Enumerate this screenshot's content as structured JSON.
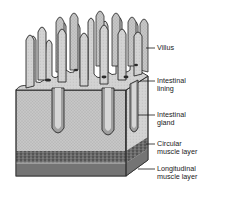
{
  "diagram": {
    "colors": {
      "tissue_fill": "#c9c9c9",
      "tissue_dark": "#8a8a8a",
      "outline": "#2a2a2a",
      "muscle_circular": "#5a5a5a",
      "muscle_longitudinal": "#7a7a7a",
      "background": "#ffffff"
    },
    "labels": [
      {
        "id": "villus",
        "line1": "Villus",
        "line2": ""
      },
      {
        "id": "intestinal-lining",
        "line1": "Intestinal",
        "line2": "lining"
      },
      {
        "id": "intestinal-gland",
        "line1": "Intestinal",
        "line2": "gland"
      },
      {
        "id": "circular-muscle-layer",
        "line1": "Circular",
        "line2": "muscle layer"
      },
      {
        "id": "longitudinal-muscle-layer",
        "line1": "Longitudinal",
        "line2": "muscle layer"
      }
    ]
  }
}
